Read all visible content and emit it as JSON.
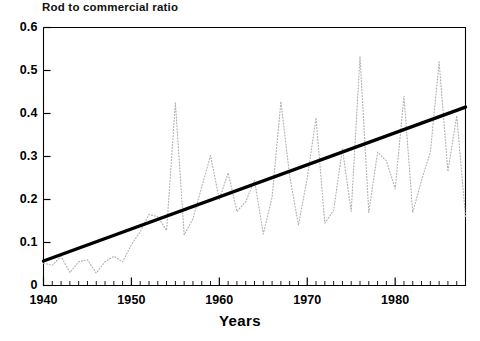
{
  "chart_data": {
    "type": "line",
    "title": "Rod to commercial ratio",
    "xlabel": "Years",
    "ylabel": "",
    "xlim": [
      1940,
      1988
    ],
    "ylim": [
      0,
      0.6
    ],
    "grid": false,
    "legend_position": "none",
    "xticks": [
      1940,
      1950,
      1960,
      1970,
      1980
    ],
    "xtick_labels": [
      "1940",
      "1950",
      "1960",
      "1970",
      "1980"
    ],
    "minor_xtick_interval": 1,
    "yticks": [
      0,
      0.1,
      0.2,
      0.3,
      0.4,
      0.5,
      0.6
    ],
    "ytick_labels": [
      "0",
      "0.1",
      "0.2",
      "0.3",
      "0.4",
      "0.5",
      "0.6"
    ],
    "series": [
      {
        "name": "Rod to commercial ratio",
        "style": "dotted",
        "color": "#b0b0b0",
        "x": [
          1940,
          1941,
          1942,
          1943,
          1944,
          1945,
          1946,
          1947,
          1948,
          1949,
          1950,
          1951,
          1952,
          1953,
          1954,
          1955,
          1956,
          1957,
          1958,
          1959,
          1960,
          1961,
          1962,
          1963,
          1964,
          1965,
          1966,
          1967,
          1968,
          1969,
          1970,
          1971,
          1972,
          1973,
          1974,
          1975,
          1976,
          1977,
          1978,
          1979,
          1980,
          1981,
          1982,
          1983,
          1984,
          1985,
          1986,
          1987,
          1988
        ],
        "values": [
          0.052,
          0.047,
          0.068,
          0.03,
          0.055,
          0.06,
          0.029,
          0.055,
          0.068,
          0.055,
          0.095,
          0.125,
          0.165,
          0.16,
          0.128,
          0.425,
          0.118,
          0.155,
          0.23,
          0.302,
          0.2,
          0.262,
          0.172,
          0.195,
          0.245,
          0.12,
          0.205,
          0.428,
          0.255,
          0.14,
          0.25,
          0.39,
          0.145,
          0.175,
          0.318,
          0.172,
          0.533,
          0.17,
          0.31,
          0.29,
          0.225,
          0.44,
          0.17,
          0.245,
          0.31,
          0.52,
          0.265,
          0.395,
          0.16
        ]
      },
      {
        "name": "Linear trend",
        "style": "solid",
        "color": "#000000",
        "x": [
          1940,
          1988
        ],
        "values": [
          0.057,
          0.415
        ]
      }
    ]
  },
  "axes": {
    "title": "Rod to commercial ratio",
    "xlabel": "Years"
  }
}
